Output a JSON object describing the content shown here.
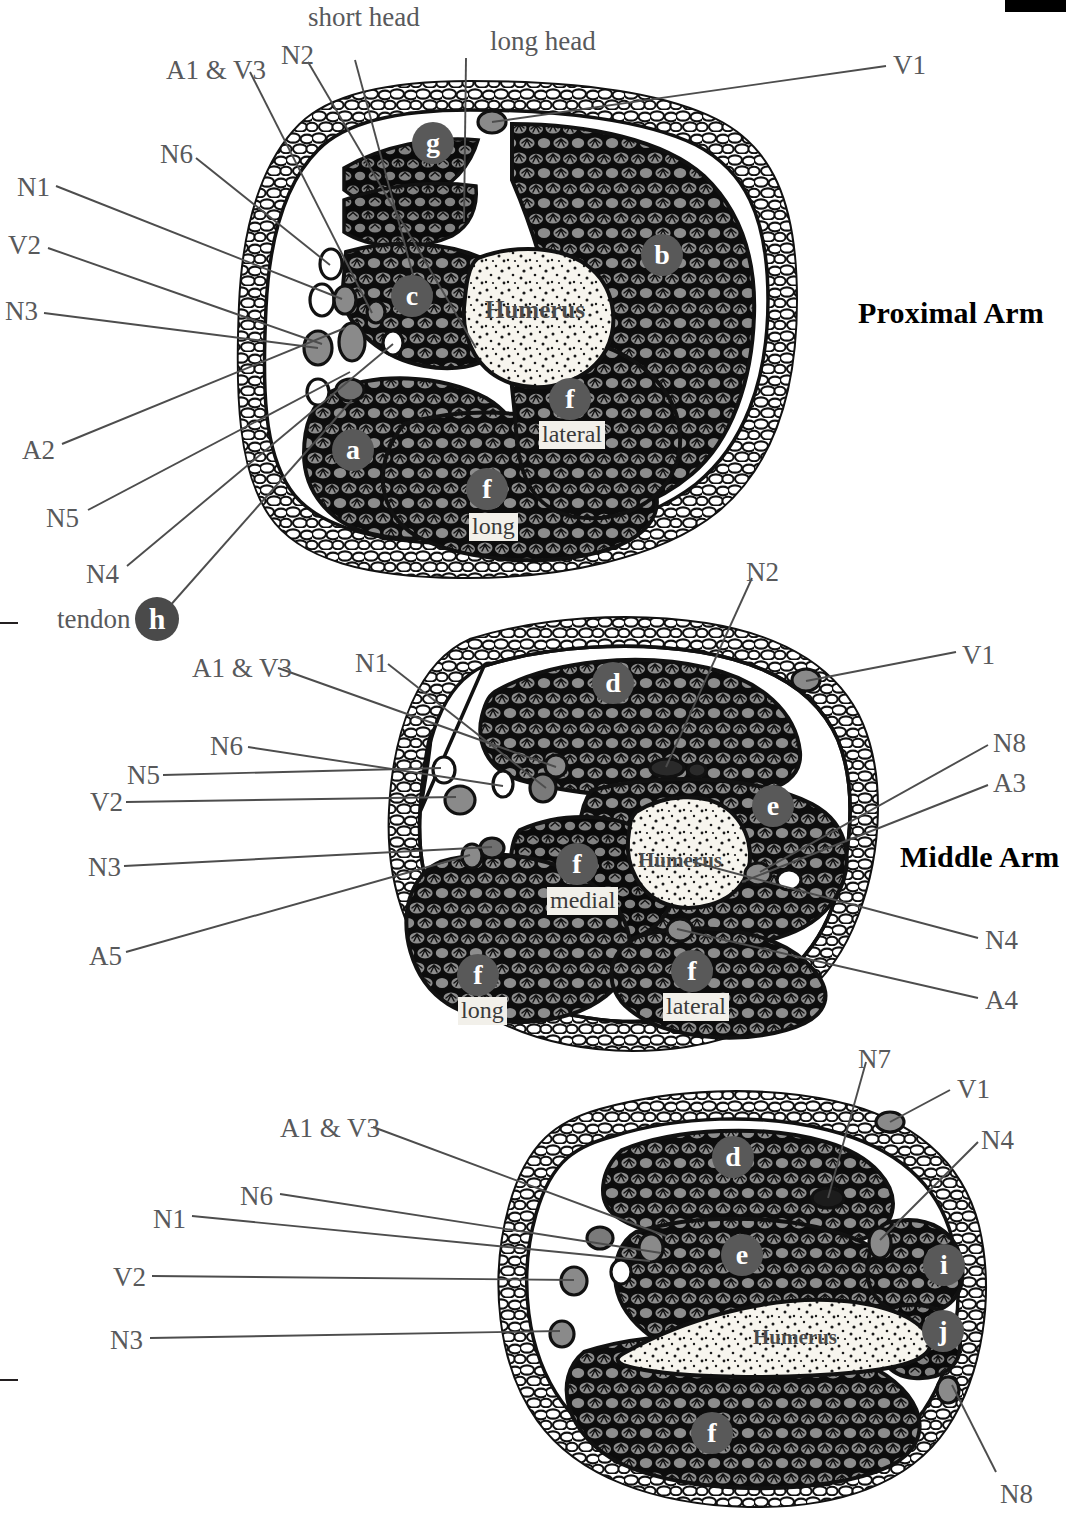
{
  "page": {
    "width": 1066,
    "height": 1523,
    "background": "#ffffff",
    "ink": "#231f20",
    "label_color": "#58595b",
    "muscle_gray": "#8a8a8a",
    "muscle_dark": "#111111",
    "bone_fill": "#f7f5ee",
    "key_circle_fill": "#595959"
  },
  "black_tab": {
    "name": "page-edge-tab"
  },
  "left_bracket": {
    "name": "side-bracket"
  },
  "sections": [
    {
      "id": "proximal",
      "title": "Proximal Arm",
      "bone_label": "Humerus",
      "key_circles": [
        {
          "letter": "g",
          "x": 433,
          "y": 143
        },
        {
          "letter": "b",
          "x": 662,
          "y": 255
        },
        {
          "letter": "c",
          "x": 412,
          "y": 296
        },
        {
          "letter": "f",
          "x": 570,
          "y": 399
        },
        {
          "letter": "a",
          "x": 353,
          "y": 450
        },
        {
          "letter": "f",
          "x": 487,
          "y": 489
        },
        {
          "letter": "h",
          "x": 157,
          "y": 619
        }
      ],
      "box_words": [
        {
          "text": "lateral",
          "x": 539,
          "y": 421
        },
        {
          "text": "long",
          "x": 469,
          "y": 513
        }
      ],
      "leader_labels": [
        {
          "text": "short head",
          "x": 308,
          "y": 4
        },
        {
          "text": "long head",
          "x": 490,
          "y": 28
        },
        {
          "text": "N2",
          "x": 281,
          "y": 42
        },
        {
          "text": "A1 & V3",
          "x": 166,
          "y": 57
        },
        {
          "text": "V1",
          "x": 893,
          "y": 52
        },
        {
          "text": "N6",
          "x": 160,
          "y": 141
        },
        {
          "text": "N1",
          "x": 17,
          "y": 174
        },
        {
          "text": "V2",
          "x": 8,
          "y": 232
        },
        {
          "text": "N3",
          "x": 5,
          "y": 298
        },
        {
          "text": "A2",
          "x": 22,
          "y": 437
        },
        {
          "text": "N5",
          "x": 46,
          "y": 505
        },
        {
          "text": "N4",
          "x": 86,
          "y": 561
        },
        {
          "text": "tendon",
          "x": 57,
          "y": 606
        }
      ]
    },
    {
      "id": "middle",
      "title": "Middle Arm",
      "bone_label": "Humerus",
      "key_circles": [
        {
          "letter": "d",
          "x": 613,
          "y": 683
        },
        {
          "letter": "e",
          "x": 773,
          "y": 806
        },
        {
          "letter": "f",
          "x": 577,
          "y": 864
        },
        {
          "letter": "f",
          "x": 478,
          "y": 975
        },
        {
          "letter": "f",
          "x": 692,
          "y": 971
        }
      ],
      "box_words": [
        {
          "text": "medial",
          "x": 547,
          "y": 887
        },
        {
          "text": "long",
          "x": 458,
          "y": 997
        },
        {
          "text": "lateral",
          "x": 663,
          "y": 993
        }
      ],
      "leader_labels": [
        {
          "text": "N2",
          "x": 746,
          "y": 559
        },
        {
          "text": "V1",
          "x": 962,
          "y": 642
        },
        {
          "text": "A1 & V3",
          "x": 192,
          "y": 655
        },
        {
          "text": "N1",
          "x": 355,
          "y": 650
        },
        {
          "text": "N6",
          "x": 210,
          "y": 733
        },
        {
          "text": "N5",
          "x": 127,
          "y": 762
        },
        {
          "text": "N8",
          "x": 993,
          "y": 730
        },
        {
          "text": "A3",
          "x": 993,
          "y": 770
        },
        {
          "text": "V2",
          "x": 90,
          "y": 789
        },
        {
          "text": "N3",
          "x": 88,
          "y": 854
        },
        {
          "text": "N4",
          "x": 985,
          "y": 927
        },
        {
          "text": "A5",
          "x": 89,
          "y": 943
        },
        {
          "text": "A4",
          "x": 985,
          "y": 987
        }
      ]
    },
    {
      "id": "distal",
      "title": "",
      "bone_label": "Humerus",
      "key_circles": [
        {
          "letter": "d",
          "x": 733,
          "y": 1157
        },
        {
          "letter": "e",
          "x": 742,
          "y": 1255
        },
        {
          "letter": "i",
          "x": 944,
          "y": 1265
        },
        {
          "letter": "j",
          "x": 943,
          "y": 1331
        },
        {
          "letter": "f",
          "x": 712,
          "y": 1433
        }
      ],
      "box_words": [],
      "leader_labels": [
        {
          "text": "N7",
          "x": 858,
          "y": 1046
        },
        {
          "text": "V1",
          "x": 957,
          "y": 1076
        },
        {
          "text": "N4",
          "x": 981,
          "y": 1127
        },
        {
          "text": "A1 & V3",
          "x": 280,
          "y": 1115
        },
        {
          "text": "N6",
          "x": 240,
          "y": 1183
        },
        {
          "text": "N1",
          "x": 153,
          "y": 1206
        },
        {
          "text": "V2",
          "x": 113,
          "y": 1264
        },
        {
          "text": "N3",
          "x": 110,
          "y": 1327
        },
        {
          "text": "N8",
          "x": 1000,
          "y": 1481
        }
      ]
    }
  ],
  "legend_keys": [
    "a",
    "b",
    "c",
    "d",
    "e",
    "f",
    "g",
    "h",
    "i",
    "j"
  ],
  "leader_lines": [
    {
      "id": "p-shorthead",
      "from": [
        355,
        60
      ],
      "to": [
        416,
        286
      ]
    },
    {
      "id": "p-longhead",
      "from": [
        466,
        58
      ],
      "to": [
        464,
        222
      ]
    },
    {
      "id": "p-n2",
      "from": [
        308,
        62
      ],
      "to": [
        476,
        348
      ]
    },
    {
      "id": "p-a1v3",
      "from": [
        250,
        72
      ],
      "to": [
        372,
        313
      ]
    },
    {
      "id": "p-v1",
      "from": [
        886,
        66
      ],
      "to": [
        492,
        122
      ]
    },
    {
      "id": "p-n6",
      "from": [
        196,
        158
      ],
      "to": [
        330,
        265
      ]
    },
    {
      "id": "p-n1",
      "from": [
        56,
        186
      ],
      "to": [
        342,
        299
      ]
    },
    {
      "id": "p-v2",
      "from": [
        48,
        248
      ],
      "to": [
        322,
        344
      ]
    },
    {
      "id": "p-n3",
      "from": [
        44,
        313
      ],
      "to": [
        318,
        348
      ]
    },
    {
      "id": "p-a2",
      "from": [
        62,
        444
      ],
      "to": [
        345,
        328
      ]
    },
    {
      "id": "p-n5",
      "from": [
        88,
        510
      ],
      "to": [
        350,
        372
      ]
    },
    {
      "id": "p-n4",
      "from": [
        127,
        566
      ],
      "to": [
        393,
        344
      ]
    },
    {
      "id": "p-h",
      "from": [
        168,
        608
      ],
      "to": [
        352,
        400
      ]
    },
    {
      "id": "m-n2",
      "from": [
        752,
        578
      ],
      "to": [
        666,
        767
      ]
    },
    {
      "id": "m-v1",
      "from": [
        956,
        652
      ],
      "to": [
        806,
        681
      ]
    },
    {
      "id": "m-a1v3",
      "from": [
        278,
        668
      ],
      "to": [
        556,
        767
      ]
    },
    {
      "id": "m-n1",
      "from": [
        388,
        664
      ],
      "to": [
        546,
        788
      ]
    },
    {
      "id": "m-n6",
      "from": [
        248,
        747
      ],
      "to": [
        503,
        786
      ]
    },
    {
      "id": "m-n5",
      "from": [
        163,
        775
      ],
      "to": [
        441,
        768
      ]
    },
    {
      "id": "m-n8",
      "from": [
        988,
        745
      ],
      "to": [
        760,
        872
      ]
    },
    {
      "id": "m-a3",
      "from": [
        988,
        785
      ],
      "to": [
        742,
        882
      ]
    },
    {
      "id": "m-v2",
      "from": [
        126,
        802
      ],
      "to": [
        456,
        797
      ]
    },
    {
      "id": "m-n3",
      "from": [
        124,
        866
      ],
      "to": [
        492,
        847
      ]
    },
    {
      "id": "m-n4",
      "from": [
        978,
        938
      ],
      "to": [
        693,
        862
      ]
    },
    {
      "id": "m-a5",
      "from": [
        126,
        952
      ],
      "to": [
        470,
        855
      ]
    },
    {
      "id": "m-a4",
      "from": [
        978,
        998
      ],
      "to": [
        677,
        929
      ]
    },
    {
      "id": "d-n7",
      "from": [
        866,
        1062
      ],
      "to": [
        828,
        1198
      ]
    },
    {
      "id": "d-v1",
      "from": [
        950,
        1090
      ],
      "to": [
        890,
        1122
      ]
    },
    {
      "id": "d-n4",
      "from": [
        978,
        1142
      ],
      "to": [
        880,
        1240
      ]
    },
    {
      "id": "d-a1v3",
      "from": [
        373,
        1127
      ],
      "to": [
        666,
        1236
      ]
    },
    {
      "id": "d-n6",
      "from": [
        280,
        1194
      ],
      "to": [
        661,
        1253
      ]
    },
    {
      "id": "d-n1",
      "from": [
        192,
        1216
      ],
      "to": [
        650,
        1261
      ]
    },
    {
      "id": "d-v2",
      "from": [
        152,
        1276
      ],
      "to": [
        574,
        1280
      ]
    },
    {
      "id": "d-n3",
      "from": [
        150,
        1338
      ],
      "to": [
        560,
        1331
      ]
    },
    {
      "id": "d-n8",
      "from": [
        996,
        1472
      ],
      "to": [
        952,
        1385
      ]
    }
  ]
}
